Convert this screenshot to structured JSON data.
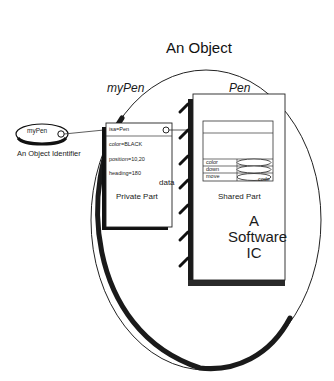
{
  "diagram": {
    "object_title": "An Object",
    "identifier": {
      "label": "myPen",
      "caption": "An Object Identifier"
    },
    "private_part": {
      "title": "myPen",
      "rows": [
        "isa=Pen",
        "color=BLACK",
        "position=10,20",
        "heading=180"
      ],
      "corner_label": "data",
      "caption": "Private Part"
    },
    "shared_part": {
      "title": "Pen",
      "methods": [
        "color",
        "down",
        "move"
      ],
      "code_label": "code",
      "caption": "Shared Part",
      "chip_text": [
        "A",
        "Software",
        "IC"
      ]
    }
  }
}
